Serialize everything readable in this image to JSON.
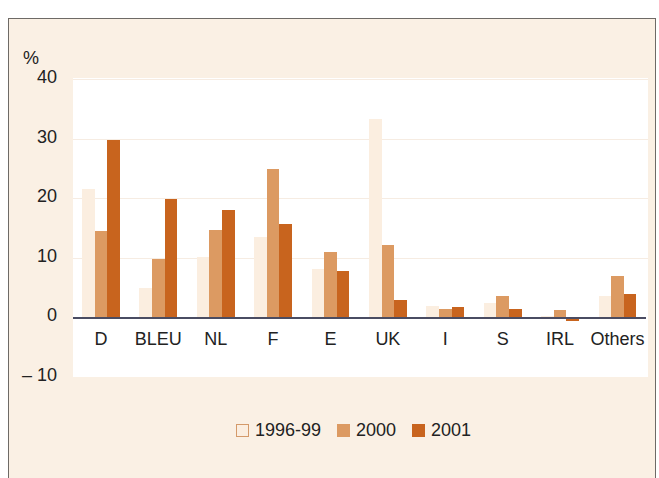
{
  "chart_data": {
    "type": "bar",
    "title": "",
    "xlabel": "",
    "ylabel": "%",
    "ylim": [
      -10,
      40
    ],
    "yticks": [
      40,
      30,
      20,
      10,
      0,
      -10
    ],
    "ytick_labels": [
      "40",
      "30",
      "20",
      "10",
      "0",
      "– 10"
    ],
    "grid": true,
    "legend_position": "bottom",
    "categories": [
      "D",
      "BLEU",
      "NL",
      "F",
      "E",
      "UK",
      "I",
      "S",
      "IRL",
      "Others"
    ],
    "series": [
      {
        "name": "1996-99",
        "color": "#fbeee0",
        "values": [
          21.5,
          4.9,
          10.1,
          13.4,
          8.0,
          33.2,
          1.8,
          2.4,
          0.2,
          3.6
        ]
      },
      {
        "name": "2000",
        "color": "#dc9a62",
        "values": [
          14.5,
          9.7,
          14.7,
          24.9,
          11.0,
          12.1,
          1.3,
          3.5,
          1.1,
          6.9
        ]
      },
      {
        "name": "2001",
        "color": "#c8641e",
        "values": [
          29.7,
          19.8,
          17.9,
          15.6,
          7.7,
          2.9,
          1.7,
          1.4,
          -0.6,
          3.9
        ]
      }
    ]
  },
  "legend": {
    "items": [
      {
        "label": "1996-99",
        "color": "#fbeee0",
        "border": "#d49a6a"
      },
      {
        "label": "2000",
        "color": "#dc9a62",
        "border": "#dc9a62"
      },
      {
        "label": "2001",
        "color": "#c8641e",
        "border": "#c8641e"
      }
    ]
  },
  "axis": {
    "y_unit": "%"
  }
}
